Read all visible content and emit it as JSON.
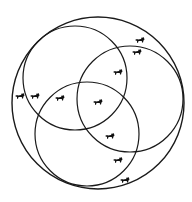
{
  "diagram": {
    "type": "venn",
    "stroke_color": "#1a1a1a",
    "icon_color": "#111111",
    "outer": {
      "name": "universe",
      "cx": 98,
      "cy": 103,
      "r": 86
    },
    "circles": [
      {
        "name": "set-a-top-left",
        "cx": 75,
        "cy": 78,
        "r": 52
      },
      {
        "name": "set-b-right",
        "cx": 130,
        "cy": 99,
        "r": 53
      },
      {
        "name": "set-c-bottom",
        "cx": 87,
        "cy": 134,
        "r": 52
      }
    ],
    "icons": [
      {
        "semantic": "cat-icon",
        "x": 140,
        "y": 40
      },
      {
        "semantic": "cat-icon",
        "x": 137,
        "y": 52
      },
      {
        "semantic": "cat-icon",
        "x": 118,
        "y": 72
      },
      {
        "semantic": "cat-icon",
        "x": 20,
        "y": 96
      },
      {
        "semantic": "cat-icon",
        "x": 35,
        "y": 96
      },
      {
        "semantic": "cat-icon",
        "x": 60,
        "y": 98
      },
      {
        "semantic": "cat-icon",
        "x": 98,
        "y": 102
      },
      {
        "semantic": "cat-icon",
        "x": 110,
        "y": 136
      },
      {
        "semantic": "cat-icon",
        "x": 118,
        "y": 160
      },
      {
        "semantic": "cat-icon",
        "x": 125,
        "y": 180
      }
    ]
  }
}
